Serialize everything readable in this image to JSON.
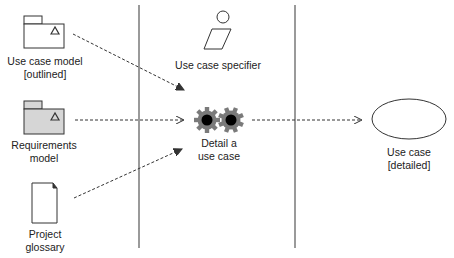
{
  "diagram": {
    "type": "workflow-detail",
    "colors": {
      "line": "#333333",
      "swimlane": "#9a9a9a",
      "package_fill_gray": "#d6d6d6",
      "gear": "#7a7a7a",
      "gear_center": "#000000"
    },
    "swimlanes": [
      {
        "x": 139
      },
      {
        "x": 295
      }
    ],
    "role": {
      "label": "Use case specifier",
      "icon": "worker-icon"
    },
    "activity": {
      "label_line1": "Detail a",
      "label_line2": "use case",
      "icon": "gears-icon"
    },
    "inputs": [
      {
        "label_line1": "Use case model",
        "label_line2": "[outlined]",
        "icon": "package-icon"
      },
      {
        "label_line1": "Requirements",
        "label_line2": "model",
        "icon": "package-icon-filled"
      },
      {
        "label_line1": "Project",
        "label_line2": "glossary",
        "icon": "document-icon"
      }
    ],
    "outputs": [
      {
        "label_line1": "Use case",
        "label_line2": "[detailed]",
        "icon": "use-case-ellipse-icon"
      }
    ]
  }
}
